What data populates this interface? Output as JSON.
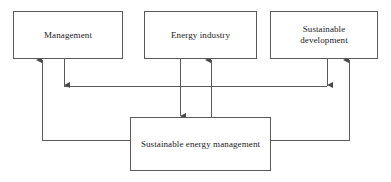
{
  "diagram": {
    "type": "block-flow-diagram",
    "stroke_color": "#5a5a5a",
    "text_color": "#1a1a1a",
    "background_color": "#ffffff",
    "nodes": [
      {
        "id": "management",
        "label": "Management",
        "row": "top",
        "position": "left"
      },
      {
        "id": "energy",
        "label": "Energy industry",
        "row": "top",
        "position": "center"
      },
      {
        "id": "sustdev",
        "label": "Sustainable\ndevelopment",
        "row": "top",
        "position": "right"
      },
      {
        "id": "sem",
        "label": "Sustainable energy management",
        "row": "bottom",
        "position": "center"
      }
    ],
    "edges": [
      {
        "from": "sem",
        "to": "management",
        "direction": "up",
        "arrowhead": "at-management",
        "route": "left-riser"
      },
      {
        "from": "management",
        "to": "sustdev",
        "direction": "right",
        "arrowhead": "at-sustdev",
        "route": "mid-horizontal"
      },
      {
        "from": "energy",
        "to": "sem",
        "direction": "down",
        "arrowhead": "at-sem",
        "route": "straight"
      },
      {
        "from": "sem",
        "to": "energy",
        "direction": "up",
        "arrowhead": "at-energy",
        "route": "straight"
      },
      {
        "from": "sem",
        "to": "sustdev",
        "direction": "up",
        "arrowhead": "at-sustdev",
        "route": "right-riser"
      }
    ]
  }
}
